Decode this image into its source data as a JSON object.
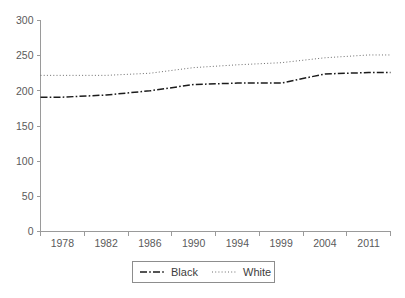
{
  "chart_data": {
    "type": "line",
    "title": "",
    "xlabel": "",
    "ylabel": "",
    "grid": false,
    "legend_position": "bottom",
    "x": [
      1978,
      1982,
      1986,
      1990,
      1994,
      1999,
      2004,
      2011
    ],
    "xtick_labels": [
      "1978",
      "1982",
      "1986",
      "1990",
      "1994",
      "1999",
      "2004",
      "2011"
    ],
    "ytick_labels": [
      "0",
      "50",
      "100",
      "150",
      "200",
      "250",
      "300"
    ],
    "ytick_values": [
      0,
      50,
      100,
      150,
      200,
      250,
      300
    ],
    "ylim": [
      0,
      300
    ],
    "series": [
      {
        "name": "Black",
        "style": "dash-dot",
        "color": "#1c1c1c",
        "values": [
          191,
          194,
          200,
          209,
          211,
          211,
          224,
          226
        ]
      },
      {
        "name": "White",
        "style": "dotted",
        "color": "#6e6e6e",
        "values": [
          222,
          222,
          225,
          233,
          237,
          240,
          247,
          251
        ]
      }
    ]
  },
  "legend": {
    "entries": [
      {
        "label": "Black",
        "style": "dash-dot"
      },
      {
        "label": "White",
        "style": "dotted"
      }
    ]
  },
  "colors": {
    "axis": "#9a9a9a",
    "tick_text": "#5a5a5a",
    "legend_text": "#3d3d3d",
    "series_black": "#1c1c1c",
    "series_white": "#6e6e6e",
    "background": "#ffffff"
  }
}
